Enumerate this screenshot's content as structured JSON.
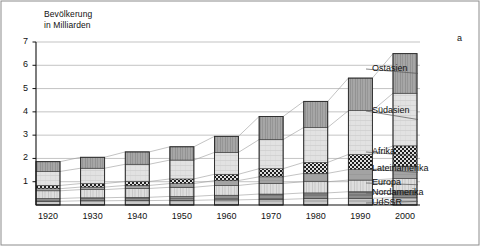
{
  "figure": {
    "label": "a",
    "axis_title": "Bevölkerung\nin Milliarden"
  },
  "chart_data": {
    "type": "bar",
    "stacked": true,
    "title": "Bevölkerung in Milliarden",
    "xlabel": "",
    "ylabel": "Bevölkerung in Milliarden",
    "ylim": [
      0,
      7
    ],
    "yticks": [
      "1",
      "2",
      "3",
      "4",
      "5",
      "6",
      "7"
    ],
    "ytick_values": [
      1,
      2,
      3,
      4,
      5,
      6,
      7
    ],
    "grid": true,
    "legend_position": "right",
    "categories": [
      "1920",
      "1930",
      "1940",
      "1950",
      "1960",
      "1970",
      "1980",
      "1990",
      "2000"
    ],
    "totals": [
      1.86,
      2.05,
      2.28,
      2.5,
      2.95,
      3.8,
      4.45,
      5.45,
      6.5
    ],
    "series": [
      {
        "name": "UdSSR",
        "pattern": "fine-horizontal",
        "color": "#b4b4b4",
        "values": [
          0.16,
          0.18,
          0.19,
          0.2,
          0.22,
          0.24,
          0.27,
          0.29,
          0.31
        ]
      },
      {
        "name": "Nordamerika",
        "pattern": "dark-horizontal",
        "color": "#8a8a8a",
        "values": [
          0.12,
          0.13,
          0.14,
          0.17,
          0.2,
          0.23,
          0.25,
          0.28,
          0.3
        ]
      },
      {
        "name": "Europa",
        "pattern": "light-vertical",
        "color": "#d2d2d2",
        "values": [
          0.33,
          0.35,
          0.38,
          0.39,
          0.42,
          0.46,
          0.48,
          0.5,
          0.52
        ]
      },
      {
        "name": "Lateinamerika",
        "pattern": "mid-solid",
        "color": "#9e9e9e",
        "values": [
          0.09,
          0.11,
          0.13,
          0.16,
          0.21,
          0.28,
          0.36,
          0.45,
          0.54
        ]
      },
      {
        "name": "Afrika",
        "pattern": "checker",
        "color": "#2b2b2b",
        "values": [
          0.14,
          0.15,
          0.17,
          0.2,
          0.27,
          0.35,
          0.47,
          0.65,
          0.87
        ]
      },
      {
        "name": "Südasien",
        "pattern": "fine-grid",
        "color": "#dcdcdc",
        "values": [
          0.6,
          0.66,
          0.74,
          0.81,
          0.94,
          1.25,
          1.5,
          1.88,
          2.26
        ]
      },
      {
        "name": "Ostasien",
        "pattern": "dense-vertical",
        "color": "#a0a0a0",
        "values": [
          0.42,
          0.47,
          0.53,
          0.57,
          0.69,
          0.99,
          1.12,
          1.4,
          1.7
        ]
      }
    ]
  },
  "legend": {
    "items": [
      {
        "label": "Ostasien"
      },
      {
        "label": "Südasien"
      },
      {
        "label": "Afrika"
      },
      {
        "label": "Lateinamerika"
      },
      {
        "label": "Europa"
      },
      {
        "label": "Nordamerika"
      },
      {
        "label": "UdSSR"
      }
    ]
  }
}
